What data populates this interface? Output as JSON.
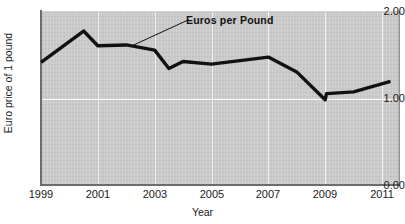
{
  "chart_data": {
    "type": "line",
    "title": "",
    "xlabel": "Year",
    "ylabel": "Euro price of 1 pound",
    "xlim": [
      1999,
      2011.6
    ],
    "ylim": [
      0.0,
      2.0
    ],
    "grid": true,
    "legend_position": "inline-annotation",
    "annotations": [
      {
        "text": "Euros per Pound",
        "x": 2004.2,
        "y": 1.9,
        "leader_to_x": 2002.2,
        "leader_to_y": 1.6
      }
    ],
    "y_ticks": [
      "0.00",
      "1.00",
      "2.00"
    ],
    "y_tick_values": [
      0.0,
      1.0,
      2.0
    ],
    "x_ticks": [
      "1999",
      "2001",
      "2003",
      "2005",
      "2007",
      "2009",
      "2011"
    ],
    "x_tick_values": [
      1999,
      2001,
      2003,
      2005,
      2007,
      2009,
      2011
    ],
    "series": [
      {
        "name": "Euros per Pound",
        "color": "#111111",
        "x": [
          1999.0,
          2000.5,
          2001.0,
          2002.0,
          2003.0,
          2003.5,
          2004.0,
          2005.0,
          2007.0,
          2008.0,
          2009.0,
          2009.05,
          2010.0,
          2011.3
        ],
        "values": [
          1.41,
          1.77,
          1.6,
          1.61,
          1.55,
          1.34,
          1.42,
          1.39,
          1.47,
          1.3,
          0.98,
          1.05,
          1.07,
          1.19
        ]
      }
    ]
  },
  "axes": {
    "y_title": "Euro price of 1 pound",
    "x_title": "Year"
  },
  "colors": {
    "plot_background": "#c9c9c9",
    "gridline": "#ffffff",
    "series_line": "#111111",
    "axis_spine": "#6d6d6d",
    "text": "#1a1a1a"
  }
}
